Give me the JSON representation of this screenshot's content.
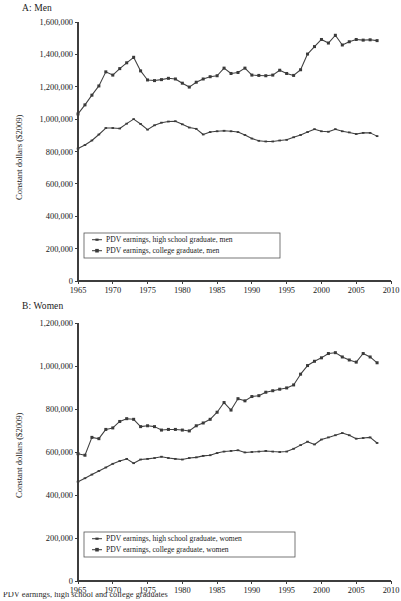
{
  "figure": {
    "background": "#ffffff",
    "ink_color": "#3a3a3a",
    "caption_partial": "PDV earnings, high school and college graduates"
  },
  "panels": [
    {
      "id": "a",
      "title": "A: Men",
      "ylabel": "Constant dollars ($2009)",
      "xlabel": "",
      "ytick_labels": [
        "0",
        "200,000",
        "400,000",
        "600,000",
        "800,000",
        "1,000,000",
        "1,200,000",
        "1,400,000",
        "1,600,000"
      ],
      "xtick_labels": [
        "1965",
        "1970",
        "1975",
        "1980",
        "1985",
        "1990",
        "1995",
        "2000",
        "2005",
        "2010"
      ],
      "legend": [
        "PDV earnings, high school graduate, men",
        "PDV earnings, college graduate, men"
      ]
    },
    {
      "id": "b",
      "title": "B: Women",
      "ylabel": "Constant dollars ($2009)",
      "xlabel": "",
      "ytick_labels": [
        "0",
        "200,000",
        "400,000",
        "600,000",
        "800,000",
        "1,000,000",
        "1,200,000"
      ],
      "xtick_labels": [
        "1965",
        "1970",
        "1975",
        "1980",
        "1985",
        "1990",
        "1995",
        "2000",
        "2005",
        "2010"
      ],
      "legend": [
        "PDV earnings, high school graduate, women",
        "PDV earnings, college graduate, women"
      ]
    }
  ],
  "chart_data": [
    {
      "type": "line",
      "title": "A: Men",
      "xlabel": "",
      "ylabel": "Constant dollars ($2009)",
      "xlim": [
        1965,
        2010
      ],
      "ylim": [
        0,
        1600000
      ],
      "ytick_interval": 200000,
      "xtick_interval": 5,
      "grid": false,
      "legend_position": "bottom-left",
      "x": [
        1965,
        1966,
        1967,
        1968,
        1969,
        1970,
        1971,
        1972,
        1973,
        1974,
        1975,
        1976,
        1977,
        1978,
        1979,
        1980,
        1981,
        1982,
        1983,
        1984,
        1985,
        1986,
        1987,
        1988,
        1989,
        1990,
        1991,
        1992,
        1993,
        1994,
        1995,
        1996,
        1997,
        1998,
        1999,
        2000,
        2001,
        2002,
        2003,
        2004,
        2005,
        2006,
        2007,
        2008
      ],
      "series": [
        {
          "name": "PDV earnings, high school graduate, men",
          "marker": "plus",
          "values": [
            818000,
            840000,
            868000,
            905000,
            945000,
            945000,
            942000,
            972000,
            1000000,
            970000,
            935000,
            962000,
            978000,
            985000,
            987000,
            968000,
            948000,
            940000,
            905000,
            920000,
            925000,
            928000,
            925000,
            920000,
            902000,
            880000,
            866000,
            862000,
            862000,
            868000,
            872000,
            888000,
            902000,
            920000,
            938000,
            925000,
            922000,
            938000,
            925000,
            918000,
            908000,
            915000,
            915000,
            895000
          ]
        },
        {
          "name": "PDV earnings, college graduate, men",
          "marker": "square",
          "values": [
            1032000,
            1088000,
            1148000,
            1205000,
            1292000,
            1272000,
            1312000,
            1348000,
            1382000,
            1298000,
            1242000,
            1238000,
            1244000,
            1252000,
            1248000,
            1222000,
            1198000,
            1228000,
            1248000,
            1262000,
            1268000,
            1315000,
            1282000,
            1288000,
            1315000,
            1272000,
            1270000,
            1268000,
            1272000,
            1302000,
            1282000,
            1270000,
            1305000,
            1402000,
            1448000,
            1492000,
            1470000,
            1518000,
            1458000,
            1478000,
            1492000,
            1488000,
            1490000,
            1485000
          ]
        }
      ]
    },
    {
      "type": "line",
      "title": "B: Women",
      "xlabel": "",
      "ylabel": "Constant dollars ($2009)",
      "xlim": [
        1965,
        2010
      ],
      "ylim": [
        0,
        1200000
      ],
      "ytick_interval": 200000,
      "xtick_interval": 5,
      "grid": false,
      "legend_position": "bottom-left",
      "x": [
        1965,
        1966,
        1967,
        1968,
        1969,
        1970,
        1971,
        1972,
        1973,
        1974,
        1975,
        1976,
        1977,
        1978,
        1979,
        1980,
        1981,
        1982,
        1983,
        1984,
        1985,
        1986,
        1987,
        1988,
        1989,
        1990,
        1991,
        1992,
        1993,
        1994,
        1995,
        1996,
        1997,
        1998,
        1999,
        2000,
        2001,
        2002,
        2003,
        2004,
        2005,
        2006,
        2007,
        2008
      ],
      "series": [
        {
          "name": "PDV earnings, high school graduate, women",
          "marker": "plus",
          "values": [
            462000,
            478000,
            495000,
            512000,
            528000,
            545000,
            558000,
            568000,
            548000,
            565000,
            568000,
            572000,
            578000,
            572000,
            568000,
            565000,
            572000,
            575000,
            582000,
            585000,
            595000,
            602000,
            605000,
            608000,
            598000,
            600000,
            602000,
            605000,
            602000,
            600000,
            602000,
            615000,
            632000,
            648000,
            635000,
            658000,
            668000,
            678000,
            688000,
            678000,
            662000,
            665000,
            668000,
            642000
          ]
        },
        {
          "name": "PDV earnings, college graduate, women",
          "marker": "square",
          "values": [
            592000,
            585000,
            668000,
            662000,
            705000,
            712000,
            742000,
            755000,
            752000,
            718000,
            722000,
            718000,
            702000,
            705000,
            705000,
            702000,
            698000,
            722000,
            735000,
            752000,
            785000,
            830000,
            795000,
            848000,
            838000,
            858000,
            862000,
            878000,
            885000,
            892000,
            898000,
            912000,
            962000,
            1002000,
            1022000,
            1038000,
            1058000,
            1062000,
            1042000,
            1028000,
            1018000,
            1058000,
            1042000,
            1015000
          ]
        }
      ]
    }
  ]
}
